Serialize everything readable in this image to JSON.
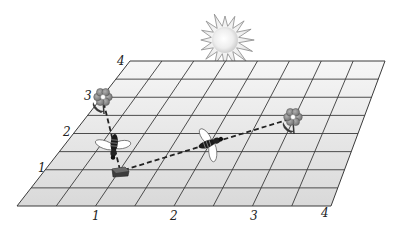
{
  "diagram": {
    "type": "bee-navigation-grid",
    "grid": {
      "cells_x": 8,
      "cells_y": 8,
      "units_x": 4,
      "units_y": 4,
      "corners": {
        "top_left": [
          130,
          61
        ],
        "top_right": [
          385,
          61
        ],
        "bottom_left": [
          17,
          206
        ],
        "bottom_right": [
          331,
          206
        ]
      },
      "fill_top": "#f5f5f5",
      "fill_bottom": "#dcdcdc",
      "line_color": "#3a3a3a"
    },
    "x_axis_labels": [
      "1",
      "2",
      "3",
      "4"
    ],
    "y_axis_labels": [
      "1",
      "2",
      "3",
      "4"
    ],
    "sun": {
      "center": [
        225,
        40
      ],
      "inner_radius": 14,
      "outer_radius": 30,
      "points": 16
    },
    "hive": {
      "label": "beehive",
      "position": [
        120,
        172
      ]
    },
    "flowers": [
      {
        "label": "flower-left",
        "position": [
          103,
          97
        ]
      },
      {
        "label": "flower-right",
        "position": [
          293,
          117
        ]
      }
    ],
    "bees": [
      {
        "label": "bee-left",
        "position": [
          114,
          146
        ],
        "angle": 95
      },
      {
        "label": "bee-right",
        "position": [
          210,
          143
        ],
        "angle": -20
      }
    ],
    "paths": [
      {
        "label": "path-hive-to-left-flower",
        "from": [
          120,
          170
        ],
        "to": [
          103,
          100
        ]
      },
      {
        "label": "path-hive-to-right-flower",
        "from": [
          124,
          170
        ],
        "to": [
          290,
          119
        ]
      }
    ]
  }
}
